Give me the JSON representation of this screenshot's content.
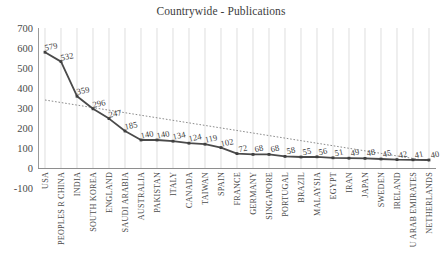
{
  "chart_data": {
    "type": "line",
    "title": "Countrywide - Publications",
    "xlabel": "",
    "ylabel": "",
    "ylim": [
      -100,
      700
    ],
    "yticks": [
      700,
      600,
      500,
      400,
      300,
      200,
      100,
      0,
      -100
    ],
    "grid": "vertical-only",
    "legend": "none",
    "categories": [
      "USA",
      "PEOPLES R CHINA",
      "INDIA",
      "SOUTH KOREA",
      "ENGLAND",
      "SAUDI ARABIA",
      "AUSTRALIA",
      "PAKISTAN",
      "ITALY",
      "CANADA",
      "TAIWAN",
      "SPAIN",
      "FRANCE",
      "GERMANY",
      "SINGAPORE",
      "PORTUGAL",
      "BRAZIL",
      "MALAYSIA",
      "EGYPT",
      "IRAN",
      "JAPAN",
      "SWEDEN",
      "IRELAND",
      "U ARAB EMIRATES",
      "NETHERLANDS"
    ],
    "values": [
      579,
      532,
      359,
      296,
      247,
      185,
      140,
      140,
      134,
      124,
      119,
      102,
      72,
      68,
      68,
      58,
      55,
      56,
      51,
      49,
      48,
      45,
      42,
      41,
      40
    ],
    "series": [
      {
        "name": "Publications",
        "color": "#4a4a4a",
        "style": "solid",
        "values": [
          579,
          532,
          359,
          296,
          247,
          185,
          140,
          140,
          134,
          124,
          119,
          102,
          72,
          68,
          68,
          58,
          55,
          56,
          51,
          49,
          48,
          45,
          42,
          41,
          40
        ]
      },
      {
        "name": "Trendline",
        "color": "#8c8c8c",
        "style": "dotted",
        "start_value": 340,
        "end_value": 35
      }
    ],
    "data_labels": [
      "579",
      "532",
      "359",
      "296",
      "247",
      "185",
      "140",
      "140",
      "134",
      "124",
      "119",
      "102",
      "72",
      "68",
      "68",
      "58",
      "55",
      "56",
      "51",
      "49",
      "48",
      "45",
      "42",
      "41",
      "40"
    ]
  }
}
